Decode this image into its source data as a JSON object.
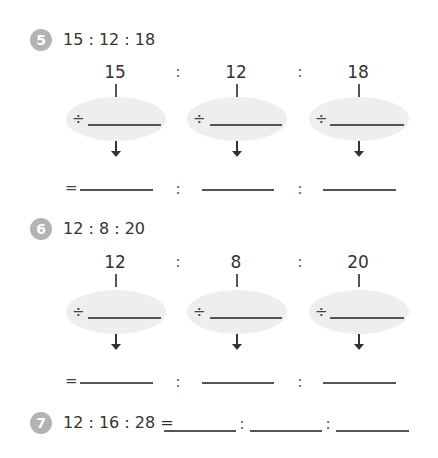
{
  "problems": [
    {
      "number": "5",
      "title": "15 : 12 : 18",
      "values": [
        "15",
        "12",
        "18"
      ],
      "separator": ":",
      "divide_symbol": "÷",
      "equals_symbol": "="
    },
    {
      "number": "6",
      "title": "12 : 8 : 20",
      "values": [
        "12",
        "8",
        "20"
      ],
      "separator": ":",
      "divide_symbol": "÷",
      "equals_symbol": "="
    },
    {
      "number": "7",
      "title": "12 : 16 : 28 =",
      "separator": ":"
    }
  ],
  "colors": {
    "badge": "#b3b3b3",
    "ellipse": "#eeeeee",
    "text": "#333333"
  }
}
